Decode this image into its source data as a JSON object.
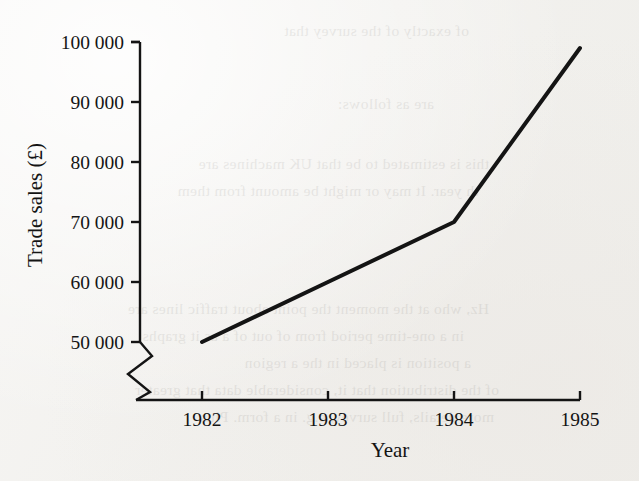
{
  "figure": {
    "background_color": "#f2f1ee",
    "ink_color": "#141414"
  },
  "axes": {
    "y_axis_title": "Trade sales (£)",
    "x_axis_title": "Year",
    "y_tick_labels": [
      "100 000",
      "90 000",
      "80 000",
      "70 000",
      "60 000",
      "50 000"
    ],
    "x_tick_labels": [
      "1982",
      "1983",
      "1984",
      "1985"
    ],
    "y_axis_break": "zigzag",
    "grid": "off"
  },
  "bleed_through_text": [
    "of exactly of the survey that",
    "are as follows:",
    "this is estimated to be that UK machines are",
    "th year. It may or might be amount from them",
    "Hz, who at the moment the point about traffic lines are",
    "in a one-time period from of out of  a as it graphs",
    "a position is placed in the a region",
    "of the distribution that it, considerable data that greater",
    "more details, full survey, e.g. in a form. Plus"
  ],
  "chart_data": {
    "type": "line",
    "title": "",
    "xlabel": "Year",
    "ylabel": "Trade sales (£)",
    "x": [
      1982,
      1983,
      1984,
      1985
    ],
    "values": [
      50000,
      60000,
      70000,
      99000
    ],
    "series": [
      {
        "name": "Trade sales",
        "x": [
          1982,
          1983,
          1984,
          1985
        ],
        "values": [
          50000,
          60000,
          70000,
          99000
        ]
      }
    ],
    "xlim": [
      1982,
      1985
    ],
    "ylim": [
      50000,
      100000
    ],
    "y_ticks": [
      50000,
      60000,
      70000,
      80000,
      90000,
      100000
    ],
    "x_ticks": [
      1982,
      1983,
      1984,
      1985
    ],
    "y_axis_broken_below": 50000,
    "line_color": "#141414",
    "line_width": 4,
    "markers": "none",
    "legend": "none"
  }
}
